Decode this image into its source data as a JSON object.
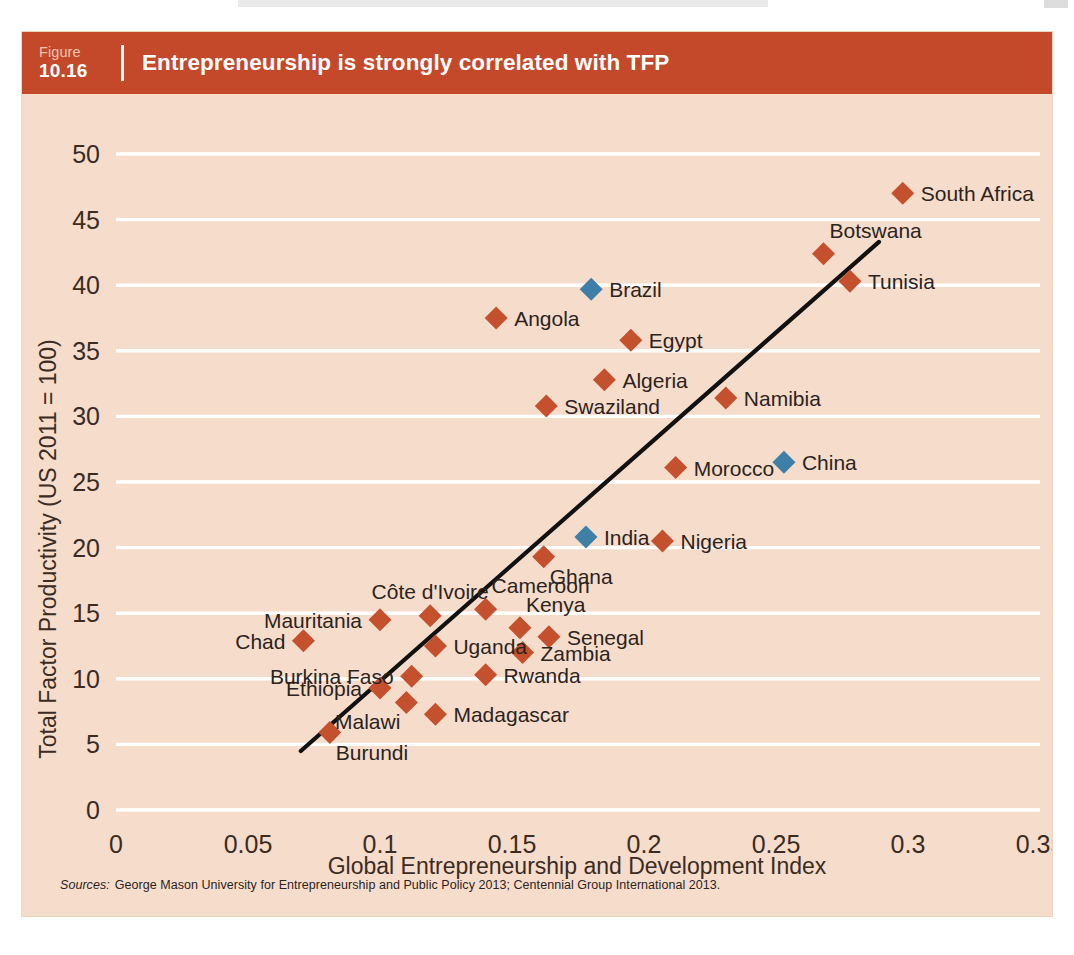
{
  "figure": {
    "word": "Figure",
    "number": "10.16",
    "title": "Entrepreneurship is strongly correlated with TFP"
  },
  "sources": {
    "label": "Sources:",
    "text": "George Mason University for Entrepreneurship and Public Policy 2013; Centennial Group International 2013."
  },
  "colors": {
    "header_bar": "#c4492a",
    "panel_background": "#f6ddcb",
    "gridline": "#ffffff",
    "africa_marker": "#c4502e",
    "comparator_marker": "#3e7fa8",
    "trendline": "#111111",
    "text": "#2d231d"
  },
  "chart_data": {
    "type": "scatter",
    "title": "Entrepreneurship is strongly correlated with TFP",
    "xlabel": "Global Entrepreneurship and Development  Index",
    "ylabel": "Total Factor Productivity (US 2011 = 100)",
    "xlim": [
      0,
      0.35
    ],
    "ylim": [
      0,
      50
    ],
    "xticks": [
      "0",
      "0.05",
      "0.1",
      "0.15",
      "0.2",
      "0.25",
      "0.3",
      "0.35"
    ],
    "xtick_values": [
      0,
      0.05,
      0.1,
      0.15,
      0.2,
      0.25,
      0.3,
      0.35
    ],
    "yticks": [
      "0",
      "5",
      "10",
      "15",
      "20",
      "25",
      "30",
      "35",
      "40",
      "45",
      "50"
    ],
    "ytick_values": [
      0,
      5,
      10,
      15,
      20,
      25,
      30,
      35,
      40,
      45,
      50
    ],
    "grid": "horizontal",
    "legend": "none",
    "series": [
      {
        "name": "Africa",
        "color": "#c4502e",
        "marker": "diamond",
        "points": [
          {
            "label": "South Africa",
            "x": 0.298,
            "y": 47.0,
            "label_pos": "right"
          },
          {
            "label": "Botswana",
            "x": 0.268,
            "y": 42.4,
            "label_pos": "above-right"
          },
          {
            "label": "Tunisia",
            "x": 0.278,
            "y": 40.3,
            "label_pos": "right"
          },
          {
            "label": "Angola",
            "x": 0.144,
            "y": 37.5,
            "label_pos": "right"
          },
          {
            "label": "Egypt",
            "x": 0.195,
            "y": 35.8,
            "label_pos": "right"
          },
          {
            "label": "Algeria",
            "x": 0.185,
            "y": 32.8,
            "label_pos": "right"
          },
          {
            "label": "Swaziland",
            "x": 0.163,
            "y": 30.8,
            "label_pos": "right"
          },
          {
            "label": "Namibia",
            "x": 0.231,
            "y": 31.4,
            "label_pos": "right"
          },
          {
            "label": "Morocco",
            "x": 0.212,
            "y": 26.1,
            "label_pos": "right"
          },
          {
            "label": "Nigeria",
            "x": 0.207,
            "y": 20.5,
            "label_pos": "right"
          },
          {
            "label": "Ghana",
            "x": 0.162,
            "y": 19.3,
            "label_pos": "below-right"
          },
          {
            "label": "Côte d'Ivoire",
            "x": 0.119,
            "y": 14.8,
            "label_pos": "above"
          },
          {
            "label": "Cameroon",
            "x": 0.14,
            "y": 15.3,
            "label_pos": "above-right"
          },
          {
            "label": "Mauritania",
            "x": 0.1,
            "y": 14.5,
            "label_pos": "left"
          },
          {
            "label": "Kenya",
            "x": 0.153,
            "y": 13.9,
            "label_pos": "above-right"
          },
          {
            "label": "Senegal",
            "x": 0.164,
            "y": 13.2,
            "label_pos": "right"
          },
          {
            "label": "Uganda",
            "x": 0.121,
            "y": 12.5,
            "label_pos": "right"
          },
          {
            "label": "Chad",
            "x": 0.071,
            "y": 12.9,
            "label_pos": "left"
          },
          {
            "label": "Zambia",
            "x": 0.154,
            "y": 12.0,
            "label_pos": "right"
          },
          {
            "label": "Burkina Faso",
            "x": 0.112,
            "y": 10.2,
            "label_pos": "left"
          },
          {
            "label": "Rwanda",
            "x": 0.14,
            "y": 10.3,
            "label_pos": "right"
          },
          {
            "label": "Ethiopia",
            "x": 0.1,
            "y": 9.3,
            "label_pos": "left"
          },
          {
            "label": "Malawi",
            "x": 0.11,
            "y": 8.2,
            "label_pos": "below-left"
          },
          {
            "label": "Madagascar",
            "x": 0.121,
            "y": 7.3,
            "label_pos": "right"
          },
          {
            "label": "Burundi",
            "x": 0.081,
            "y": 5.9,
            "label_pos": "below-right"
          }
        ]
      },
      {
        "name": "Comparators",
        "color": "#3e7fa8",
        "marker": "diamond",
        "points": [
          {
            "label": "Brazil",
            "x": 0.18,
            "y": 39.7,
            "label_pos": "right"
          },
          {
            "label": "China",
            "x": 0.253,
            "y": 26.5,
            "label_pos": "right"
          },
          {
            "label": "India",
            "x": 0.178,
            "y": 20.8,
            "label_pos": "right"
          }
        ]
      }
    ],
    "trendline": {
      "x0": 0.07,
      "y0": 4.5,
      "x1": 0.289,
      "y1": 43.3
    }
  }
}
